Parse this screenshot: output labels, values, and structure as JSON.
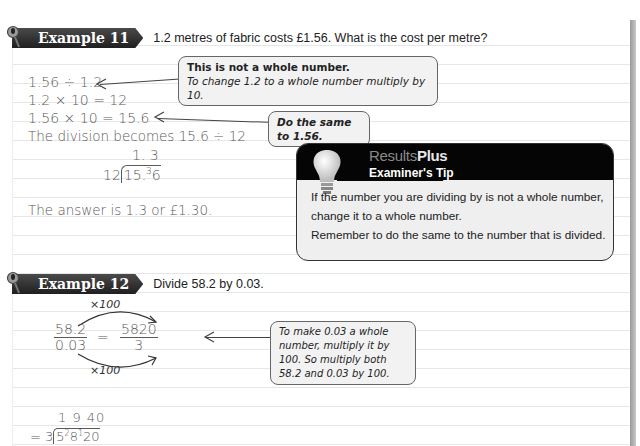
{
  "page": {
    "accent_dark": "#1f1f1f",
    "callout_bg": "#f2f2f2",
    "tip_bg": "#efefef"
  },
  "example11": {
    "tag": "Example 11",
    "question": "1.2 metres of fabric costs £1.56. What is the cost per metre?",
    "steps": [
      "1.56 ÷ 1.2",
      "1.2 × 10 = 12",
      "1.56 × 10 = 15.6",
      "The division becomes 15.6 ÷ 12"
    ],
    "long_division": {
      "quotient": "1. 3",
      "divisor": "12",
      "dividend_main": "15.",
      "carry": "3",
      "dividend_last": "6"
    },
    "answer": "The answer is 1.3 or £1.30.",
    "callouts": [
      {
        "line1": "This is not a whole number.",
        "line2": "To change 1.2 to a whole number multiply by 10."
      },
      {
        "line1": "Do the same to 1.56."
      }
    ]
  },
  "tip": {
    "brand_light": "Results",
    "brand_bold": "Plus",
    "title": "Examiner's Tip",
    "lines": [
      "If the number you are dividing by is not a whole number,",
      "change it to a whole number.",
      "Remember to do the same to the number that is divided."
    ]
  },
  "example12": {
    "tag": "Example 12",
    "question": "Divide 58.2 by 0.03.",
    "multiplier_top": "×100",
    "multiplier_bottom": "×100",
    "fraction_left": {
      "num": "58.2",
      "den": "0.03"
    },
    "equals": "=",
    "fraction_right": {
      "num": "5820",
      "den": "3"
    },
    "callout": {
      "lines": [
        "To make 0.03 a whole",
        "number, multiply it by",
        "100. So multiply both",
        "58.2 and 0.03 by 100."
      ]
    },
    "short_division": {
      "quotient": "1 9 40",
      "prefix": "= 3",
      "d1": "5",
      "c1": "2",
      "d2": "8",
      "c2": "1",
      "d3": "20"
    }
  }
}
